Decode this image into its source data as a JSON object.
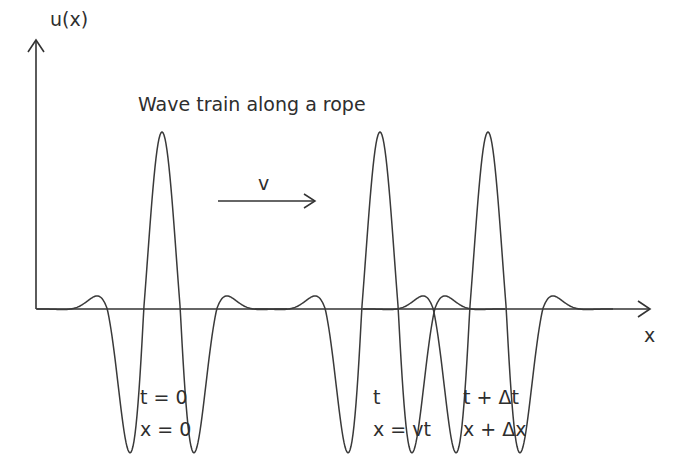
{
  "diagram": {
    "title": "Wave train along a rope",
    "axes": {
      "y_label": "u(x)",
      "x_label": "x"
    },
    "velocity_label": "v",
    "pulses": [
      {
        "name": "initial",
        "center_px": 162,
        "time_label": "t = 0",
        "position_label": "x = 0"
      },
      {
        "name": "at-t",
        "center_px": 380,
        "time_label": "t",
        "position_label": "x = vt"
      },
      {
        "name": "at-t-plus-dt",
        "center_px": 488,
        "time_label": "t + Δt",
        "position_label": "x + Δx"
      }
    ],
    "colors": {
      "stroke": "#3a3a3a",
      "axis": "#333333",
      "background": "#ffffff"
    }
  }
}
